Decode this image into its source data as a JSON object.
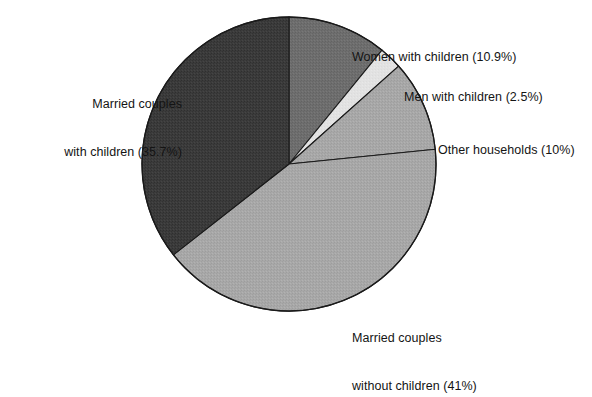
{
  "chart_data": {
    "type": "pie",
    "title": "",
    "subtitle": "",
    "xlabel": "",
    "ylabel": "",
    "legend_position": "none",
    "grid": false,
    "labels_outside": true,
    "start_angle_deg": 90,
    "direction": "clockwise",
    "categories": [
      "Women with children",
      "Men with children",
      "Other households",
      "Married couples without children",
      "Married couples with children"
    ],
    "values": [
      10.9,
      2.5,
      10,
      41,
      35.7
    ],
    "value_unit": "%",
    "slices": [
      {
        "name": "Women with children",
        "label_lines": [
          "Women with children (10.9%)"
        ],
        "value": 10.9,
        "value_text": "10.9%",
        "color": "#6e6e6e",
        "start_deg": 90,
        "end_deg": 50.76
      },
      {
        "name": "Men with children",
        "label_lines": [
          "Men with children (2.5%)"
        ],
        "value": 2.5,
        "value_text": "2.5%",
        "color": "#e2e2e2",
        "start_deg": 50.76,
        "end_deg": 41.76
      },
      {
        "name": "Other households",
        "label_lines": [
          "Other households (10%)"
        ],
        "value": 10,
        "value_text": "10%",
        "color": "#a8a8a8",
        "start_deg": 41.76,
        "end_deg": 5.76
      },
      {
        "name": "Married couples without children",
        "label_lines": [
          "Married couples",
          "without children (41%)"
        ],
        "value": 41,
        "value_text": "41%",
        "color": "#a8a8a8",
        "start_deg": 5.76,
        "end_deg": -141.84
      },
      {
        "name": "Married couples with children",
        "label_lines": [
          "Married couples",
          "with children (35.7%)"
        ],
        "value": 35.7,
        "value_text": "35.7%",
        "color": "#3b3b3b",
        "start_deg": -141.84,
        "end_deg": -270
      }
    ],
    "colors": {
      "outline": "#1a1a1a",
      "background": "#ffffff",
      "dark_gray": "#3b3b3b",
      "medium_gray": "#6e6e6e",
      "light_medium_gray": "#a8a8a8",
      "very_light_gray": "#e2e2e2"
    }
  },
  "labels": {
    "married_with_children": {
      "line1": "Married couples",
      "line2": "with children (35.7%)"
    },
    "women_with_children": {
      "line1": "Women with children (10.9%)"
    },
    "men_with_children": {
      "line1": "Men with children (2.5%)"
    },
    "other_households": {
      "line1": "Other households (10%)"
    },
    "married_without_children": {
      "line1": "Married couples",
      "line2": "without children (41%)"
    }
  }
}
